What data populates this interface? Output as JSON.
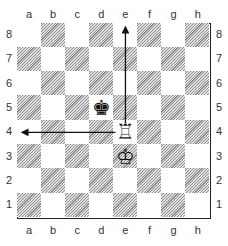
{
  "diagram": {
    "files": [
      "a",
      "b",
      "c",
      "d",
      "e",
      "f",
      "g",
      "h"
    ],
    "ranks": [
      "8",
      "7",
      "6",
      "5",
      "4",
      "3",
      "2",
      "1"
    ],
    "pieces": [
      {
        "square": "d5",
        "piece": "black-king",
        "glyph": "♚"
      },
      {
        "square": "e4",
        "piece": "white-rook",
        "glyph": "♖"
      },
      {
        "square": "e3",
        "piece": "white-king",
        "glyph": "♔"
      }
    ],
    "arrows": [
      {
        "from": "e4",
        "to": "e8",
        "direction": "up"
      },
      {
        "from": "e4",
        "to": "a4",
        "direction": "left"
      }
    ],
    "colors": {
      "border": "#222222",
      "dark_square": "#8a8a8a",
      "light_square": "#ffffff",
      "arrow": "#111111"
    }
  }
}
